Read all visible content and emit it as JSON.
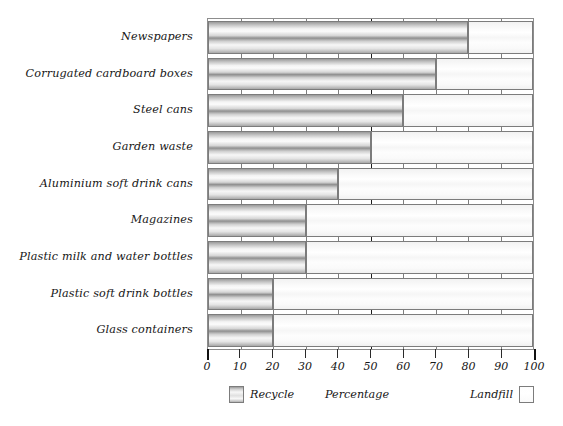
{
  "chart_data": {
    "type": "bar",
    "orientation": "horizontal",
    "stacked": true,
    "title": "",
    "xlabel": "Percentage",
    "ylabel": "",
    "xlim": [
      0,
      100
    ],
    "xticks": [
      0,
      10,
      20,
      30,
      40,
      50,
      60,
      70,
      80,
      90,
      100
    ],
    "xtick_labels": [
      "0",
      "10",
      "20",
      "30",
      "40",
      "50",
      "60",
      "70",
      "80",
      "90",
      "100"
    ],
    "grid": true,
    "major_gridline_at": 50,
    "legend_position": "bottom",
    "categories": [
      "Newspapers",
      "Corrugated cardboard boxes",
      "Steel cans",
      "Garden waste",
      "Aluminium soft drink cans",
      "Magazines",
      "Plastic milk and water bottles",
      "Plastic soft drink bottles",
      "Glass containers"
    ],
    "series": [
      {
        "name": "Recycle",
        "color": "#b5b5b5",
        "values": [
          80,
          70,
          60,
          50,
          40,
          30,
          30,
          20,
          20
        ]
      },
      {
        "name": "Landfill",
        "color": "#fbfbfb",
        "values": [
          20,
          30,
          40,
          50,
          60,
          70,
          70,
          80,
          80
        ]
      }
    ]
  },
  "legend": {
    "recycle_label": "Recycle",
    "axis_title": "Percentage",
    "landfill_label": "Landfill"
  }
}
